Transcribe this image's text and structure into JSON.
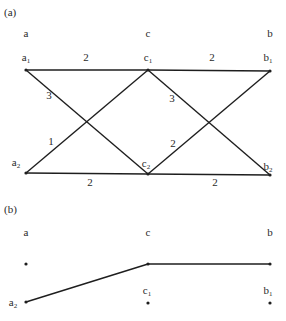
{
  "panel_a": {
    "label": "(a)",
    "columns": [
      {
        "id": "a",
        "label": "a",
        "x": 26
      },
      {
        "id": "c",
        "label": "c",
        "x": 148
      },
      {
        "id": "b",
        "label": "b",
        "x": 270
      }
    ],
    "nodes": [
      {
        "id": "a1",
        "base": "a",
        "sub": "1",
        "x": 26,
        "y": 70,
        "lx": 26,
        "ly": 61
      },
      {
        "id": "c1",
        "base": "c",
        "sub": "1",
        "x": 148,
        "y": 70,
        "lx": 148,
        "ly": 61
      },
      {
        "id": "b1",
        "base": "b",
        "sub": "1",
        "x": 270,
        "y": 71,
        "lx": 268,
        "ly": 61
      },
      {
        "id": "a2",
        "base": "a",
        "sub": "2",
        "x": 26,
        "y": 173,
        "lx": 16,
        "ly": 166
      },
      {
        "id": "c2",
        "base": "c",
        "sub": "2",
        "x": 148,
        "y": 174,
        "lx": 146,
        "ly": 167
      },
      {
        "id": "b2",
        "base": "b",
        "sub": "2",
        "x": 270,
        "y": 175,
        "lx": 268,
        "ly": 170
      }
    ],
    "edges": [
      {
        "from": "a1",
        "to": "c1",
        "weight": "2",
        "wx": 86,
        "wy": 61
      },
      {
        "from": "c1",
        "to": "b1",
        "weight": "2",
        "wx": 212,
        "wy": 61
      },
      {
        "from": "a1",
        "to": "c2",
        "weight": "3",
        "wx": 49,
        "wy": 99
      },
      {
        "from": "a2",
        "to": "c1",
        "weight": "1",
        "wx": 51,
        "wy": 145
      },
      {
        "from": "c1",
        "to": "b2",
        "weight": "3",
        "wx": 172,
        "wy": 102
      },
      {
        "from": "c2",
        "to": "b1",
        "weight": "2",
        "wx": 173,
        "wy": 147
      },
      {
        "from": "a2",
        "to": "c2",
        "weight": "2",
        "wx": 90,
        "wy": 186
      },
      {
        "from": "c2",
        "to": "b2",
        "weight": "2",
        "wx": 215,
        "wy": 186
      }
    ]
  },
  "panel_b": {
    "label": "(b)",
    "columns": [
      {
        "id": "a",
        "label": "a",
        "x": 26
      },
      {
        "id": "c",
        "label": "c",
        "x": 148
      },
      {
        "id": "b",
        "label": "b",
        "x": 270
      }
    ],
    "nodes": [
      {
        "id": "a",
        "base": "",
        "sub": "",
        "x": 26,
        "y": 264
      },
      {
        "id": "c",
        "base": "",
        "sub": "",
        "x": 148,
        "y": 264
      },
      {
        "id": "b",
        "base": "",
        "sub": "",
        "x": 270,
        "y": 264
      },
      {
        "id": "a2",
        "base": "a",
        "sub": "2",
        "x": 26,
        "y": 302,
        "lx": 13,
        "ly": 306
      },
      {
        "id": "c1",
        "base": "c",
        "sub": "1",
        "x": 148,
        "y": 303,
        "lx": 147,
        "ly": 294
      },
      {
        "id": "b1",
        "base": "b",
        "sub": "1",
        "x": 270,
        "y": 303,
        "lx": 268,
        "ly": 294
      }
    ],
    "edges": [
      {
        "from": "a2",
        "to": "c"
      },
      {
        "from": "c",
        "to": "b"
      }
    ]
  }
}
